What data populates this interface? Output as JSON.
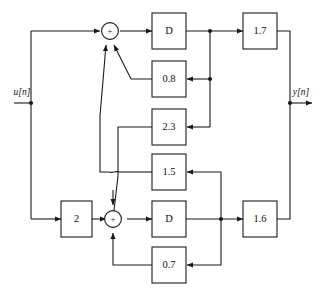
{
  "diagram": {
    "io": {
      "input_label": "u[n]",
      "output_label": "y[n]"
    },
    "summers": [
      {
        "name": "top-summer",
        "sign": "+"
      },
      {
        "name": "bottom-summer",
        "sign": "+"
      }
    ],
    "delays": [
      {
        "name": "delay-top",
        "label": "D"
      },
      {
        "name": "delay-bottom",
        "label": "D"
      }
    ],
    "gains": [
      {
        "name": "gain-input",
        "label": "2"
      },
      {
        "name": "gain-feedback-0-8",
        "label": "0.8"
      },
      {
        "name": "gain-feedback-2-3",
        "label": "2.3"
      },
      {
        "name": "gain-feedback-1-5",
        "label": "1.5"
      },
      {
        "name": "gain-feedback-0-7",
        "label": "0.7"
      },
      {
        "name": "gain-output-1-7",
        "label": "1.7"
      },
      {
        "name": "gain-output-1-6",
        "label": "1.6"
      }
    ],
    "colors": {
      "stroke": "#1a1a1a",
      "background": "#ffffff"
    }
  }
}
